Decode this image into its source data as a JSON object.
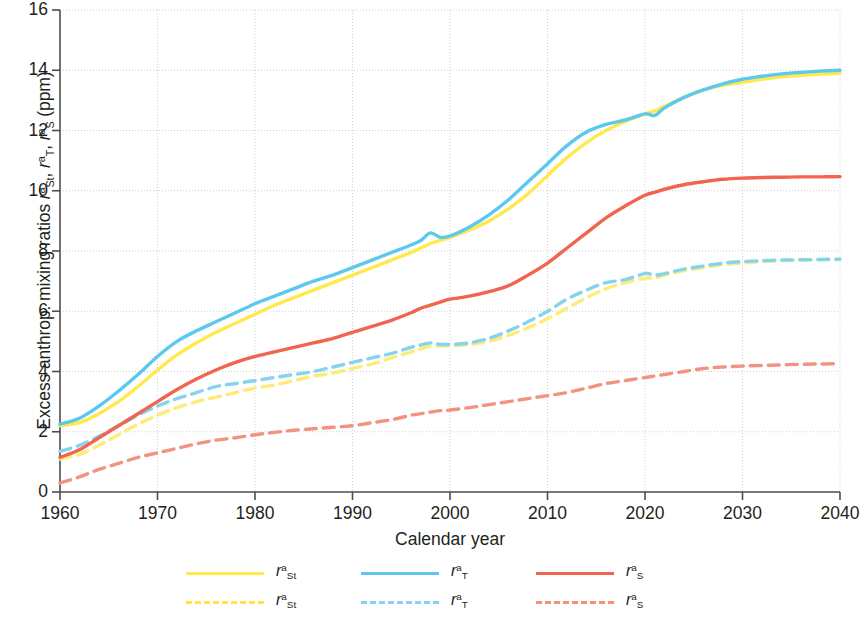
{
  "chart_data": {
    "type": "line",
    "title": "",
    "xlabel": "Calendar year",
    "ylabel": "Excess anthrop. mixing ratios rᵃSt, rᵃT, rᵃS (ppm)",
    "xlim": [
      1960,
      2040
    ],
    "ylim": [
      0,
      16
    ],
    "xticks": [
      1960,
      1970,
      1980,
      1990,
      2000,
      2010,
      2020,
      2030,
      2040
    ],
    "yticks": [
      0,
      2,
      4,
      6,
      8,
      10,
      12,
      14,
      16
    ],
    "grid": true,
    "legend_position": "below",
    "x": [
      1960,
      1962,
      1964,
      1966,
      1968,
      1970,
      1972,
      1974,
      1976,
      1978,
      1980,
      1982,
      1984,
      1986,
      1988,
      1990,
      1992,
      1994,
      1996,
      1997,
      1998,
      1999,
      2000,
      2002,
      2004,
      2006,
      2008,
      2010,
      2012,
      2014,
      2016,
      2018,
      2020,
      2021,
      2022,
      2024,
      2026,
      2028,
      2030,
      2032,
      2034,
      2036,
      2038,
      2040
    ],
    "series": [
      {
        "name": "rᵃT solid",
        "label": "r a T",
        "color": "#5BC8EE",
        "style": "solid",
        "values": [
          2.25,
          2.45,
          2.85,
          3.35,
          3.9,
          4.5,
          5.0,
          5.35,
          5.65,
          5.95,
          6.25,
          6.5,
          6.75,
          7.0,
          7.2,
          7.45,
          7.7,
          7.95,
          8.2,
          8.35,
          8.6,
          8.45,
          8.5,
          8.8,
          9.2,
          9.7,
          10.3,
          10.9,
          11.5,
          11.95,
          12.2,
          12.35,
          12.55,
          12.5,
          12.75,
          13.1,
          13.35,
          13.55,
          13.7,
          13.8,
          13.88,
          13.93,
          13.97,
          14.0
        ]
      },
      {
        "name": "rᵃSt solid",
        "label": "r a St",
        "color": "#FFE94D",
        "style": "solid",
        "values": [
          2.2,
          2.3,
          2.6,
          3.0,
          3.5,
          4.05,
          4.55,
          4.95,
          5.3,
          5.6,
          5.9,
          6.2,
          6.45,
          6.7,
          6.95,
          7.2,
          7.45,
          7.7,
          7.95,
          8.1,
          8.25,
          8.35,
          8.45,
          8.7,
          9.0,
          9.4,
          9.9,
          10.5,
          11.1,
          11.6,
          12.0,
          12.3,
          12.55,
          12.65,
          12.8,
          13.1,
          13.35,
          13.5,
          13.6,
          13.7,
          13.78,
          13.83,
          13.87,
          13.9
        ]
      },
      {
        "name": "rᵃS solid",
        "label": "r a S",
        "color": "#F06450",
        "style": "solid",
        "values": [
          1.15,
          1.4,
          1.8,
          2.2,
          2.6,
          3.0,
          3.4,
          3.75,
          4.05,
          4.3,
          4.5,
          4.65,
          4.8,
          4.95,
          5.1,
          5.3,
          5.5,
          5.7,
          5.95,
          6.1,
          6.2,
          6.3,
          6.4,
          6.5,
          6.65,
          6.85,
          7.2,
          7.6,
          8.1,
          8.6,
          9.1,
          9.5,
          9.85,
          9.95,
          10.05,
          10.2,
          10.3,
          10.38,
          10.42,
          10.44,
          10.45,
          10.46,
          10.46,
          10.47
        ]
      },
      {
        "name": "rᵃT dashed",
        "label": "r a T",
        "color": "#86D3F0",
        "style": "dashed",
        "values": [
          1.35,
          1.55,
          1.85,
          2.2,
          2.55,
          2.85,
          3.1,
          3.3,
          3.5,
          3.6,
          3.7,
          3.8,
          3.9,
          4.0,
          4.15,
          4.3,
          4.45,
          4.6,
          4.8,
          4.88,
          4.95,
          4.9,
          4.9,
          4.95,
          5.1,
          5.35,
          5.65,
          6.0,
          6.4,
          6.7,
          6.95,
          7.05,
          7.25,
          7.2,
          7.25,
          7.4,
          7.5,
          7.6,
          7.65,
          7.68,
          7.7,
          7.71,
          7.72,
          7.73
        ]
      },
      {
        "name": "rᵃSt dashed",
        "label": "r a St",
        "color": "#FDEB7A",
        "style": "dashed",
        "values": [
          1.1,
          1.25,
          1.55,
          1.9,
          2.25,
          2.55,
          2.8,
          3.0,
          3.15,
          3.3,
          3.45,
          3.55,
          3.7,
          3.85,
          3.95,
          4.1,
          4.25,
          4.45,
          4.65,
          4.75,
          4.85,
          4.85,
          4.85,
          4.9,
          5.0,
          5.2,
          5.45,
          5.75,
          6.1,
          6.45,
          6.75,
          6.95,
          7.1,
          7.1,
          7.2,
          7.35,
          7.45,
          7.55,
          7.6,
          7.65,
          7.68,
          7.7,
          7.71,
          7.72
        ]
      },
      {
        "name": "rᵃS dashed",
        "label": "r a S",
        "color": "#F2937F",
        "style": "dashed",
        "values": [
          0.3,
          0.5,
          0.75,
          0.95,
          1.15,
          1.3,
          1.45,
          1.6,
          1.72,
          1.8,
          1.9,
          1.98,
          2.05,
          2.1,
          2.15,
          2.2,
          2.3,
          2.4,
          2.55,
          2.6,
          2.65,
          2.7,
          2.72,
          2.8,
          2.9,
          3.0,
          3.1,
          3.2,
          3.3,
          3.45,
          3.6,
          3.7,
          3.8,
          3.85,
          3.9,
          4.0,
          4.1,
          4.15,
          4.18,
          4.2,
          4.22,
          4.24,
          4.25,
          4.26
        ]
      }
    ]
  },
  "axes": {
    "y_label_prefix": "Excess anthrop. mixing ratios ",
    "y_label_unit": " (ppm)",
    "x_label": "Calendar year",
    "y_tick_labels": [
      "16",
      "14",
      "12",
      "10",
      "8",
      "6",
      "4",
      "2",
      "0"
    ],
    "x_tick_labels": [
      "1960",
      "1970",
      "1980",
      "1990",
      "2000",
      "2010",
      "2020",
      "2030",
      "2040"
    ]
  },
  "symbols": {
    "r": "r",
    "sup_a": "a",
    "sub_St": "St",
    "sub_T": "T",
    "sub_S": "S"
  },
  "legend": {
    "items": [
      {
        "id": "st-solid",
        "color": "#FFE94D",
        "style": "solid",
        "base": "r",
        "sup": "a",
        "sub": "St"
      },
      {
        "id": "t-solid",
        "color": "#5BC8EE",
        "style": "solid",
        "base": "r",
        "sup": "a",
        "sub": "T"
      },
      {
        "id": "s-solid",
        "color": "#F06450",
        "style": "solid",
        "base": "r",
        "sup": "a",
        "sub": "S"
      },
      {
        "id": "st-dash",
        "color": "#FDE24D",
        "style": "dashed",
        "base": "r",
        "sup": "a",
        "sub": "St"
      },
      {
        "id": "t-dash",
        "color": "#86D3F0",
        "style": "dashed",
        "base": "r",
        "sup": "a",
        "sub": "T"
      },
      {
        "id": "s-dash",
        "color": "#F2937F",
        "style": "dashed",
        "base": "r",
        "sup": "a",
        "sub": "S"
      }
    ]
  }
}
